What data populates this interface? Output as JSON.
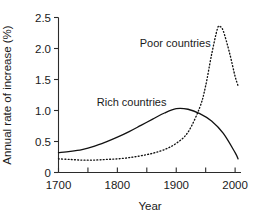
{
  "chart_data": {
    "type": "line",
    "title": "",
    "xlabel": "Year",
    "ylabel": "Annual rate of increase (%)",
    "xlim": [
      1700,
      2010
    ],
    "ylim": [
      0,
      2.5
    ],
    "grid": false,
    "legend_position": "inline-annotations",
    "x_ticks_major": [
      1700,
      1800,
      1900,
      2000
    ],
    "x_tick_labels": [
      "1700",
      "1800",
      "1900",
      "2000"
    ],
    "x_ticks_minor": [
      1750,
      1850,
      1950
    ],
    "y_ticks": [
      0,
      0.5,
      1.0,
      1.5,
      2.0,
      2.5
    ],
    "y_tick_labels": [
      "0",
      "0.5",
      "1.0",
      "1.5",
      "2.0",
      "2.5"
    ],
    "series": [
      {
        "name": "Rich countries",
        "style": "solid",
        "color": "#111111",
        "label_x": 1765,
        "label_y": 1.08,
        "x": [
          1700,
          1720,
          1740,
          1760,
          1780,
          1800,
          1820,
          1840,
          1860,
          1880,
          1900,
          1920,
          1940,
          1960,
          1980,
          2000,
          2005
        ],
        "values": [
          0.32,
          0.34,
          0.37,
          0.42,
          0.49,
          0.57,
          0.66,
          0.76,
          0.86,
          0.96,
          1.03,
          1.02,
          0.95,
          0.83,
          0.63,
          0.32,
          0.22
        ]
      },
      {
        "name": "Poor countries",
        "style": "dotted",
        "color": "#111111",
        "label_x": 1838,
        "label_y": 2.02,
        "x": [
          1700,
          1720,
          1740,
          1760,
          1780,
          1800,
          1820,
          1840,
          1860,
          1880,
          1900,
          1920,
          1940,
          1950,
          1960,
          1970,
          1975,
          1980,
          1990,
          2000,
          2005
        ],
        "values": [
          0.22,
          0.21,
          0.2,
          0.2,
          0.21,
          0.22,
          0.24,
          0.27,
          0.31,
          0.37,
          0.47,
          0.65,
          1.05,
          1.4,
          1.9,
          2.32,
          2.35,
          2.28,
          1.95,
          1.55,
          1.4
        ]
      }
    ]
  },
  "labels": {
    "xaxis_title": "Year",
    "yaxis_title": "Annual rate of increase (%)",
    "rich": "Rich countries",
    "poor": "Poor countries"
  }
}
